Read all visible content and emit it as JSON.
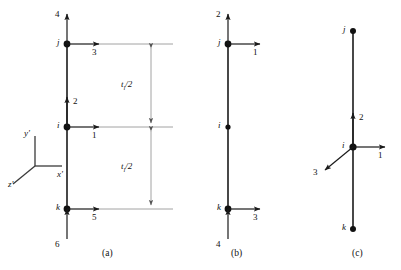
{
  "figure": {
    "title_visible": false,
    "background_color": "#ffffff",
    "line_color": "#1a1a1a",
    "dim_line_color": "#888888",
    "subfigures": [
      {
        "id": "a",
        "caption": "(a)",
        "nodes": [
          {
            "name": "j",
            "label": "j",
            "position": "top"
          },
          {
            "name": "i",
            "label": "i",
            "position": "middle"
          },
          {
            "name": "k",
            "label": "k",
            "position": "bottom"
          }
        ],
        "dof_arrows": [
          {
            "label": "4",
            "at_node": "j",
            "direction": "up"
          },
          {
            "label": "3",
            "at_node": "j",
            "direction": "right"
          },
          {
            "label": "2",
            "at_node": "i",
            "direction": "up"
          },
          {
            "label": "1",
            "at_node": "i",
            "direction": "right"
          },
          {
            "label": "6",
            "at_node": "k",
            "direction": "up"
          },
          {
            "label": "5",
            "at_node": "k",
            "direction": "right"
          }
        ],
        "dimensions": [
          {
            "label": "t",
            "subscript": "l",
            "divisor": "/2",
            "text": "t_l/2",
            "span": "j-to-i"
          },
          {
            "label": "t",
            "subscript": "l",
            "divisor": "/2",
            "text": "t_l/2",
            "span": "i-to-k"
          }
        ]
      },
      {
        "id": "b",
        "caption": "(b)",
        "nodes": [
          {
            "name": "j",
            "label": "j",
            "position": "top"
          },
          {
            "name": "i",
            "label": "i",
            "position": "middle"
          },
          {
            "name": "k",
            "label": "k",
            "position": "bottom"
          }
        ],
        "dof_arrows": [
          {
            "label": "2",
            "at_node": "j",
            "direction": "up"
          },
          {
            "label": "1",
            "at_node": "j",
            "direction": "right"
          },
          {
            "label": "4",
            "at_node": "k",
            "direction": "up"
          },
          {
            "label": "3",
            "at_node": "k",
            "direction": "right"
          }
        ],
        "dimensions": []
      },
      {
        "id": "c",
        "caption": "(c)",
        "nodes": [
          {
            "name": "j",
            "label": "j",
            "position": "top"
          },
          {
            "name": "i",
            "label": "i",
            "position": "middle"
          },
          {
            "name": "k",
            "label": "k",
            "position": "bottom"
          }
        ],
        "dof_arrows": [
          {
            "label": "2",
            "at_node": "i",
            "direction": "up"
          },
          {
            "label": "1",
            "at_node": "i",
            "direction": "right"
          },
          {
            "label": "3",
            "at_node": "i",
            "direction": "down-left"
          }
        ],
        "dimensions": []
      }
    ],
    "axis_triad": {
      "name": "local-coordinate-triad",
      "axes": [
        {
          "label": "y'",
          "direction": "up"
        },
        {
          "label": "x'",
          "direction": "right"
        },
        {
          "label": "z'",
          "direction": "down-left"
        }
      ]
    }
  },
  "labels": {
    "a": {
      "node_j": "j",
      "node_i": "i",
      "node_k": "k",
      "dof4": "4",
      "dof3": "3",
      "dof2": "2",
      "dof1": "1",
      "dof6": "6",
      "dof5": "5",
      "dim_top": "t",
      "dim_top_sub": "l",
      "dim_top_tail": "/2",
      "dim_bot": "t",
      "dim_bot_sub": "l",
      "dim_bot_tail": "/2",
      "caption": "(a)"
    },
    "b": {
      "node_j": "j",
      "node_i": "i",
      "node_k": "k",
      "dof2": "2",
      "dof1": "1",
      "dof4": "4",
      "dof3": "3",
      "caption": "(b)"
    },
    "c": {
      "node_j": "j",
      "node_i": "i",
      "node_k": "k",
      "dof2": "2",
      "dof1": "1",
      "dof3": "3",
      "caption": "(c)"
    },
    "axes": {
      "y": "y'",
      "x": "x'",
      "z": "z'"
    }
  }
}
